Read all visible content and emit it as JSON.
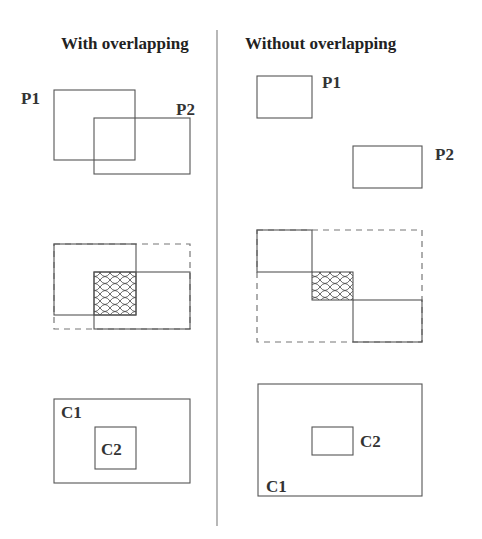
{
  "panels": {
    "left": {
      "title": "With overlapping",
      "row1": {
        "p1_label": "P1",
        "p2_label": "P2"
      },
      "row3": {
        "c1_label": "C1",
        "c2_label": "C2"
      }
    },
    "right": {
      "title": "Without overlapping",
      "row1": {
        "p1_label": "P1",
        "p2_label": "P2"
      },
      "row3": {
        "c1_label": "C1",
        "c2_label": "C2"
      }
    }
  },
  "colors": {
    "stroke": "#555555",
    "dashed": "#777777",
    "divider": "#888888",
    "text": "#222222"
  }
}
